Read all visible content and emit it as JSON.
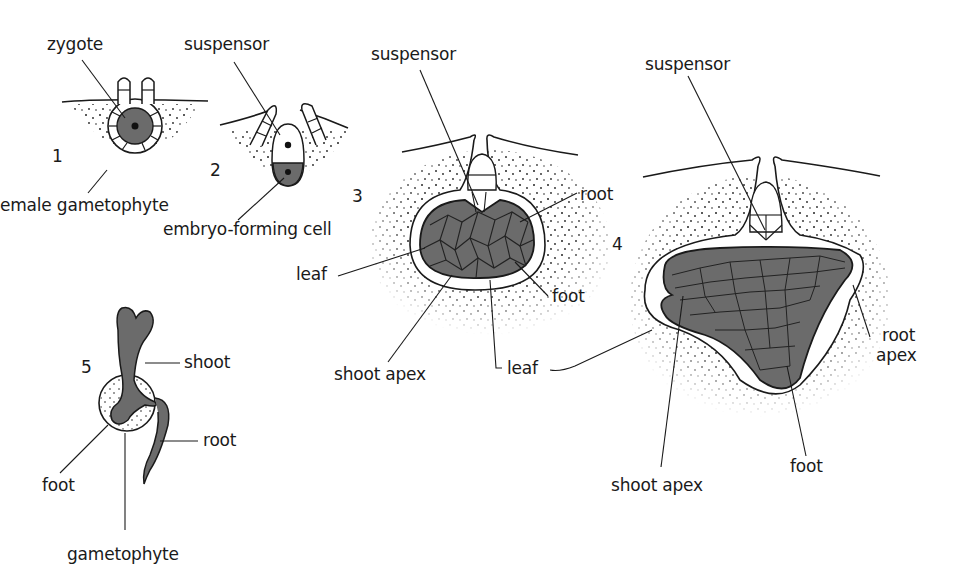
{
  "diagram": {
    "title": "",
    "stages": [
      {
        "number": "1",
        "labels": [
          "zygote",
          "emale gametophyte"
        ]
      },
      {
        "number": "2",
        "labels": [
          "suspensor",
          "embryo-forming cell"
        ]
      },
      {
        "number": "3",
        "labels": [
          "suspensor",
          "root",
          "leaf",
          "foot",
          "shoot apex",
          "leaf"
        ]
      },
      {
        "number": "4",
        "labels": [
          "suspensor",
          "root apex",
          "shoot apex",
          "foot"
        ]
      },
      {
        "number": "5",
        "labels": [
          "shoot",
          "root",
          "foot",
          "gametophyte"
        ]
      }
    ],
    "labels": {
      "s1_zygote": "zygote",
      "s1_gametophyte": "emale gametophyte",
      "s2_suspensor": "suspensor",
      "s2_embryo_cell": "embryo-forming cell",
      "s3_suspensor": "suspensor",
      "s3_root": "root",
      "s3_leaf_left": "leaf",
      "s3_foot": "foot",
      "s3_shoot_apex": "shoot apex",
      "s3_leaf_bottom": "leaf",
      "s4_suspensor": "suspensor",
      "s4_root": "root",
      "s4_apex": "apex",
      "s4_shoot_apex": "shoot apex",
      "s4_foot": "foot",
      "s5_shoot": "shoot",
      "s5_root": "root",
      "s5_foot": "foot",
      "s5_gametophyte": "gametophyte"
    },
    "numbers": {
      "n1": "1",
      "n2": "2",
      "n3": "3",
      "n4": "4",
      "n5": "5"
    },
    "colors": {
      "tissue": "#6b6b6b",
      "stipple": "#222222",
      "line": "#1a1a1a",
      "background": "#ffffff"
    }
  }
}
